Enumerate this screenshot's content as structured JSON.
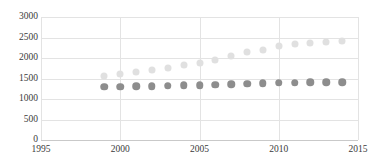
{
  "chart_data": {
    "type": "scatter",
    "title": "",
    "subtitle": "",
    "xlabel": "",
    "ylabel": "",
    "xlim": [
      1995,
      2015
    ],
    "ylim": [
      0,
      3000
    ],
    "xticks": [
      1995,
      2000,
      2005,
      2010,
      2015
    ],
    "yticks": [
      0,
      500,
      1000,
      1500,
      2000,
      2500,
      3000
    ],
    "grid": true,
    "legend": "none",
    "x": [
      1999,
      2000,
      2001,
      2002,
      2003,
      2004,
      2005,
      2006,
      2007,
      2008,
      2009,
      2010,
      2011,
      2012,
      2013,
      2014
    ],
    "series": [
      {
        "name": "series-light",
        "color": "#e0e0e0",
        "values": [
          1570,
          1600,
          1650,
          1700,
          1745,
          1830,
          1880,
          1950,
          2050,
          2135,
          2205,
          2290,
          2330,
          2355,
          2395,
          2410
        ]
      },
      {
        "name": "series-dark",
        "color": "#8d8d8d",
        "values": [
          1300,
          1300,
          1305,
          1315,
          1325,
          1335,
          1335,
          1350,
          1360,
          1375,
          1385,
          1395,
          1400,
          1410,
          1410,
          1410
        ]
      }
    ]
  },
  "axis": {
    "y_tick_labels": [
      "3000",
      "2500",
      "2000",
      "1500",
      "1000",
      "500",
      "0"
    ],
    "x_tick_labels": [
      "1995",
      "2000",
      "2005",
      "2010",
      "2015"
    ]
  },
  "colors": {
    "gridline": "#e3e3e3",
    "axis": "#c9c9c9",
    "tick_text": "#3a3a3a",
    "series_light": "#e0e0e0",
    "series_dark": "#8d8d8d"
  }
}
